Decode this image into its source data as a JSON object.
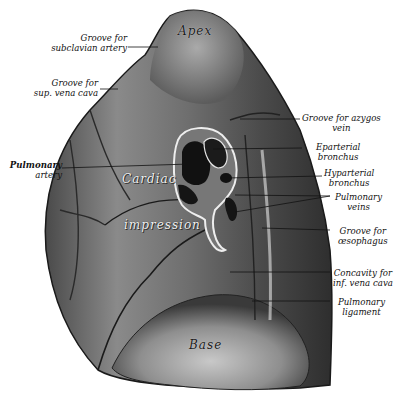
{
  "figure": {
    "colors": {
      "background": "#ffffff",
      "lung_dark": "#3a3a3a",
      "lung_mid": "#7a7a7a",
      "lung_light": "#bdbdbd",
      "ink": "#111111"
    },
    "regions": {
      "apex": "Apex",
      "cardiac": "Cardiac",
      "impression": "impression",
      "base": "Base"
    },
    "labels_left": [
      {
        "line1": "Groove for",
        "line2": "subclavian artery"
      },
      {
        "line1": "Groove for",
        "line2": "sup. vena cava"
      },
      {
        "line1": "Pulmonary",
        "line2": "artery"
      }
    ],
    "labels_right": [
      {
        "line1": "Groove for azygos",
        "line2": "vein"
      },
      {
        "line1": "Eparterial",
        "line2": "bronchus"
      },
      {
        "line1": "Hyparterial",
        "line2": "bronchus"
      },
      {
        "line1": "Pulmonary",
        "line2": "veins"
      },
      {
        "line1": "Groove for",
        "line2": "œsophagus"
      },
      {
        "line1": "Concavity for",
        "line2": "inf. vena cava"
      },
      {
        "line1": "Pulmonary",
        "line2": "ligament"
      }
    ]
  }
}
